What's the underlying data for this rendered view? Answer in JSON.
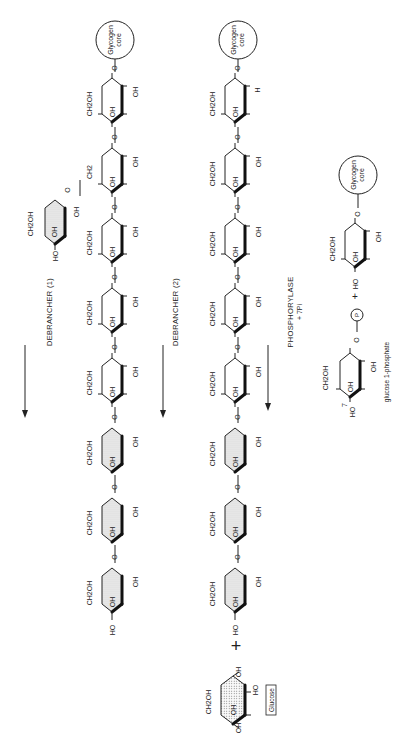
{
  "diagram": {
    "steps": [
      {
        "id": "step1",
        "arrow_label": "DEBRANCHER (1)"
      },
      {
        "id": "step2",
        "arrow_label": "DEBRANCHER (2)"
      },
      {
        "id": "step3",
        "arrow_label": "PHOSPHORYLASE",
        "arrow_sublabel": "+ 7Pi"
      }
    ],
    "labels": {
      "glycogen_core": "Glycogen",
      "glycogen_core_2": "core",
      "ch2oh": "CH2OH",
      "ch2": "CH2",
      "oh": "OH",
      "ho": "HO",
      "o": "O",
      "h": "H",
      "glucose_box": "Glucose",
      "plus": "+",
      "phosphate": "P",
      "glucose_1_phosphate": "glucose 1-phosphate",
      "seven": "7"
    },
    "rows": [
      {
        "name": "row1-branched",
        "unit_count": 7,
        "shaded_units": 3,
        "branch_unit": true
      },
      {
        "name": "row2-linear",
        "unit_count": 8,
        "shaded_units": 3,
        "free_glucose": true
      },
      {
        "name": "row3-products",
        "product": "glucose 1-phosphate",
        "count": "7"
      }
    ]
  }
}
